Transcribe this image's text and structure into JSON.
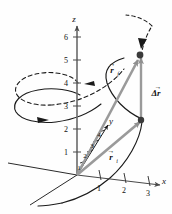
{
  "figure": {
    "background_color": "#fefefe",
    "axis_color": "#555555",
    "curve_color": "#1a1a1a",
    "vector_color": "#8a8a8a",
    "marker_color": "#3a3a3a",
    "text_color": "#111111"
  },
  "axes": {
    "z": {
      "label": "z",
      "ticks": [
        "6",
        "5",
        "4",
        "3",
        "2",
        "1"
      ]
    },
    "x": {
      "label": "x",
      "ticks": [
        "1",
        "2",
        "3"
      ]
    },
    "y": {
      "label": "y",
      "ticks": [
        "1",
        "2",
        "3",
        "4"
      ]
    }
  },
  "vectors": [
    {
      "name": "r-final",
      "symbol": "r",
      "subscript": "f",
      "arrow_accent": "→",
      "description": "final position vector from origin to upper point"
    },
    {
      "name": "r-initial",
      "symbol": "r",
      "subscript": "i",
      "arrow_accent": "→",
      "description": "initial position vector from origin to lower point"
    },
    {
      "name": "delta-r",
      "symbol": "Δr",
      "subscript": "",
      "arrow_accent": "→",
      "description": "displacement vector between the two points"
    }
  ],
  "markers": [
    {
      "name": "point-final",
      "label": ""
    },
    {
      "name": "point-initial",
      "label": ""
    }
  ],
  "curves": [
    {
      "name": "helix-solid-lower",
      "style": "solid"
    },
    {
      "name": "helix-dashed-upper",
      "style": "dashed"
    },
    {
      "name": "helix-arrow-head-top",
      "style": "dashed"
    }
  ]
}
